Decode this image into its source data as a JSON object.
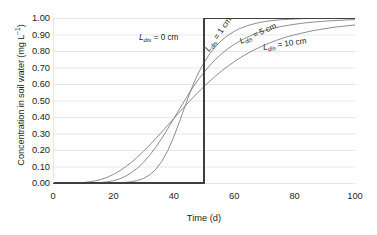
{
  "chart_data": {
    "type": "line",
    "title": "",
    "xlabel": "Time (d)",
    "ylabel": "Concentration in soil water (mg L−1)",
    "xlim": [
      0,
      100
    ],
    "ylim": [
      0,
      1.0
    ],
    "xticks": [
      "0",
      "20",
      "40",
      "60",
      "80",
      "100"
    ],
    "xtick_values": [
      0,
      20,
      40,
      60,
      80,
      100
    ],
    "yticks": [
      "0.00",
      "0.10",
      "0.20",
      "0.30",
      "0.40",
      "0.50",
      "0.60",
      "0.70",
      "0.80",
      "0.90",
      "1.00"
    ],
    "ytick_values": [
      0.0,
      0.1,
      0.2,
      0.3,
      0.4,
      0.5,
      0.6,
      0.7,
      0.8,
      0.9,
      1.0
    ],
    "grid": "horizontal",
    "legend_position": "inline-annotations",
    "x": [
      0,
      2,
      4,
      6,
      8,
      10,
      12,
      14,
      16,
      18,
      20,
      22,
      24,
      26,
      28,
      30,
      32,
      34,
      36,
      38,
      40,
      42,
      44,
      46,
      48,
      50,
      52,
      54,
      56,
      58,
      60,
      62,
      64,
      66,
      68,
      70,
      72,
      74,
      76,
      78,
      80,
      82,
      84,
      86,
      88,
      90,
      92,
      94,
      96,
      98,
      100
    ],
    "series": [
      {
        "name": "L_dis = 0 cm",
        "label": "L",
        "label_sub": "dis",
        "label_rest": " = 0 cm",
        "color": "#3f3f3f",
        "width": 2.0,
        "values": [
          0,
          0,
          0,
          0,
          0,
          0,
          0,
          0,
          0,
          0,
          0,
          0,
          0,
          0,
          0,
          0,
          0,
          0,
          0,
          0,
          0,
          0,
          0,
          0,
          0,
          0.5,
          1,
          1,
          1,
          1,
          1,
          1,
          1,
          1,
          1,
          1,
          1,
          1,
          1,
          1,
          1,
          1,
          1,
          1,
          1,
          1,
          1,
          1,
          1,
          1,
          1
        ]
      },
      {
        "name": "L_dis = 1 cm",
        "label": "L",
        "label_sub": "dis",
        "label_rest": " = 1 cm",
        "color": "#808080",
        "width": 0.9,
        "values": [
          0,
          0,
          0,
          0,
          0,
          0,
          0,
          0,
          0,
          0,
          0.001,
          0.002,
          0.004,
          0.008,
          0.015,
          0.028,
          0.049,
          0.082,
          0.13,
          0.196,
          0.28,
          0.378,
          0.48,
          0.578,
          0.662,
          0.73,
          0.786,
          0.831,
          0.867,
          0.896,
          0.919,
          0.937,
          0.951,
          0.962,
          0.971,
          0.978,
          0.983,
          0.987,
          0.99,
          0.992,
          0.994,
          0.996,
          0.997,
          0.998,
          0.998,
          0.999,
          0.999,
          0.999,
          1.0,
          1.0,
          1.0
        ]
      },
      {
        "name": "L_dis = 5 cm",
        "label": "L",
        "label_sub": "dis",
        "label_rest": " = 5 cm",
        "color": "#808080",
        "width": 0.9,
        "values": [
          0,
          0,
          0,
          0,
          0,
          0,
          0,
          0.001,
          0.003,
          0.007,
          0.014,
          0.025,
          0.041,
          0.063,
          0.091,
          0.126,
          0.168,
          0.216,
          0.27,
          0.329,
          0.39,
          0.452,
          0.512,
          0.57,
          0.623,
          0.671,
          0.714,
          0.752,
          0.786,
          0.815,
          0.84,
          0.862,
          0.881,
          0.897,
          0.911,
          0.923,
          0.933,
          0.942,
          0.95,
          0.956,
          0.962,
          0.967,
          0.971,
          0.975,
          0.978,
          0.981,
          0.983,
          0.985,
          0.987,
          0.989,
          0.99
        ]
      },
      {
        "name": "L_dis = 10 cm",
        "label": "L",
        "label_sub": "dis",
        "label_rest": " = 10 cm",
        "color": "#808080",
        "width": 0.9,
        "values": [
          0,
          0,
          0,
          0,
          0.001,
          0.003,
          0.007,
          0.013,
          0.022,
          0.035,
          0.052,
          0.073,
          0.098,
          0.126,
          0.158,
          0.193,
          0.23,
          0.269,
          0.309,
          0.35,
          0.391,
          0.432,
          0.472,
          0.511,
          0.549,
          0.585,
          0.619,
          0.651,
          0.681,
          0.709,
          0.735,
          0.759,
          0.781,
          0.801,
          0.819,
          0.836,
          0.851,
          0.865,
          0.877,
          0.888,
          0.898,
          0.907,
          0.915,
          0.923,
          0.929,
          0.935,
          0.941,
          0.946,
          0.95,
          0.954,
          0.958
        ]
      }
    ],
    "annotations": [
      {
        "text": "L",
        "sub": "dis",
        "rest": " = 0 cm",
        "rotation": 0
      },
      {
        "text": "L",
        "sub": "dis",
        "rest": " = 1 cm",
        "rotation": -55
      },
      {
        "text": "L",
        "sub": "dis",
        "rest": " = 5 cm",
        "rotation": -24
      },
      {
        "text": "L",
        "sub": "dis",
        "rest": " = 10 cm",
        "rotation": -9
      }
    ],
    "colors": {
      "grid": "#e8e8e8",
      "axis": "#3f3f3f",
      "step_curve": "#3f3f3f",
      "smooth_curves": "#808080",
      "text": "#231f20"
    }
  }
}
